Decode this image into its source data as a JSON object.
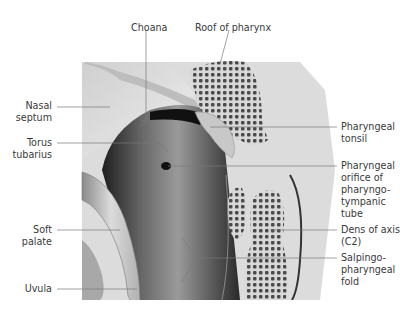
{
  "figure": {
    "labels_left": [
      {
        "id": "nasal-septum",
        "text": "Nasal\nseptum"
      },
      {
        "id": "torus-tubarius",
        "text": "Torus\ntubarius"
      },
      {
        "id": "soft-palate",
        "text": "Soft\npalate"
      },
      {
        "id": "uvula",
        "text": "Uvula"
      }
    ],
    "labels_top": [
      {
        "id": "choana",
        "text": "Choana"
      },
      {
        "id": "roof-of-pharynx",
        "text": "Roof of pharynx"
      }
    ],
    "labels_right": [
      {
        "id": "pharyngeal-tonsil",
        "text": "Pharyngeal\ntonsil"
      },
      {
        "id": "pharyngeal-orifice",
        "text": "Pharyngeal\norifice of\npharyngo-\ntympanic\ntube"
      },
      {
        "id": "dens-of-axis",
        "text": "Dens of axis\n(C2)"
      },
      {
        "id": "salpingopharyngeal-fold",
        "text": "Salpingo-\npharyngeal\nfold"
      }
    ],
    "colors": {
      "leader": "#7a7a7a",
      "text": "#3a3a3a",
      "bone": "#5a5a5a",
      "cavity": "#2a2a2a"
    }
  }
}
